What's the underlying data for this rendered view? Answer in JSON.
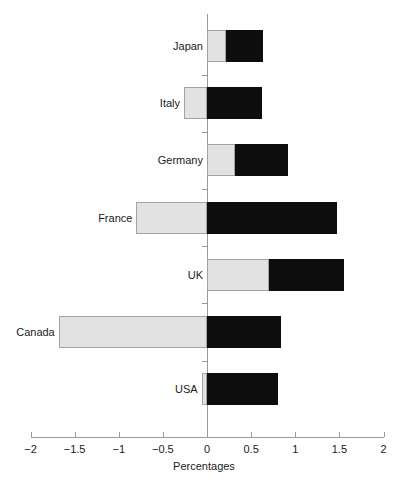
{
  "chart_data": {
    "type": "bar",
    "orientation": "horizontal",
    "stacked": true,
    "title": "",
    "xlabel": "Percentages",
    "ylabel": "",
    "xlim": [
      -2,
      2
    ],
    "xticks": [
      -2,
      -1.5,
      -1,
      -0.5,
      0,
      0.5,
      1,
      1.5,
      2
    ],
    "xtick_labels": [
      "−2",
      "−1.5",
      "−1",
      "−0.5",
      "0",
      "0.5",
      "1",
      "1.5",
      "2"
    ],
    "grid": false,
    "legend": "none",
    "categories": [
      "Japan",
      "Italy",
      "Germany",
      "France",
      "UK",
      "Canada",
      "USA"
    ],
    "series": [
      {
        "name": "light-segment",
        "color": "#e2e2e2",
        "values": [
          0.22,
          -0.26,
          0.32,
          -0.8,
          0.7,
          -1.68,
          -0.06
        ]
      },
      {
        "name": "dark-segment",
        "color": "#0d0d0d",
        "values": [
          0.63,
          0.62,
          0.92,
          1.47,
          1.55,
          0.84,
          0.8
        ]
      }
    ],
    "bars": [
      {
        "category": "Japan",
        "light_start": 0.0,
        "light_end": 0.22,
        "dark_start": 0.22,
        "dark_end": 0.63
      },
      {
        "category": "Italy",
        "light_start": -0.26,
        "light_end": 0.0,
        "dark_start": 0.0,
        "dark_end": 0.62
      },
      {
        "category": "Germany",
        "light_start": 0.0,
        "light_end": 0.32,
        "dark_start": 0.32,
        "dark_end": 0.92
      },
      {
        "category": "France",
        "light_start": -0.8,
        "light_end": 0.0,
        "dark_start": 0.0,
        "dark_end": 1.47
      },
      {
        "category": "UK",
        "light_start": 0.0,
        "light_end": 0.7,
        "dark_start": 0.7,
        "dark_end": 1.55
      },
      {
        "category": "Canada",
        "light_start": -1.68,
        "light_end": 0.0,
        "dark_start": 0.0,
        "dark_end": 0.84
      },
      {
        "category": "USA",
        "light_start": -0.06,
        "light_end": 0.0,
        "dark_start": 0.0,
        "dark_end": 0.8
      }
    ]
  },
  "axis": {
    "x_title": "Percentages"
  }
}
